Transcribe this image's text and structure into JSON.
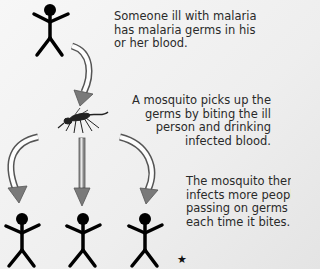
{
  "diagram": {
    "topic": "Malaria transmission by mosquito",
    "steps": [
      {
        "id": "infected-person",
        "text": "Someone ill with malaria\nhas malaria germs in his\nor her blood."
      },
      {
        "id": "mosquito-bite",
        "text": "A mosquito picks up the\ngerms by biting the ill\nperson and drinking\ninfected blood."
      },
      {
        "id": "spread",
        "text": "The mosquito then\ninfects more people,\npassing on germs\neach time it bites."
      }
    ],
    "nodes": {
      "source_person": "stick-figure",
      "vector": "mosquito",
      "targets": [
        "stick-figure",
        "stick-figure",
        "stick-figure"
      ]
    },
    "footnote_symbol": "★",
    "colors": {
      "arrow_fill": "#8a8a8a",
      "arrow_outline": "#555555",
      "figure": "#000000",
      "text": "#2a2a2a",
      "background": "#f0f0f0"
    }
  }
}
